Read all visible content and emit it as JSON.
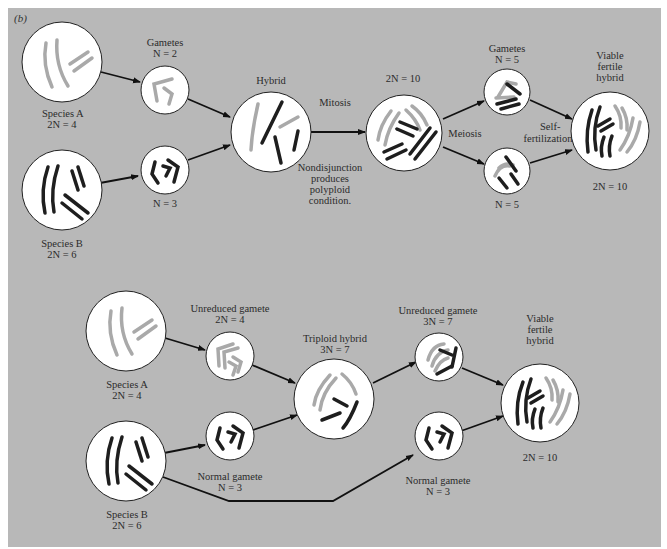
{
  "figure": {
    "panel_label": "(b)",
    "background_color": "#b8b8b8",
    "light_chromosome_color": "#a9a9a9",
    "dark_chromosome_color": "#1e1e1e"
  },
  "top_pathway": {
    "species_a": {
      "name": "Species A",
      "ploidy": "2N = 4"
    },
    "species_b": {
      "name": "Species B",
      "ploidy": "2N = 6"
    },
    "gametes_a": {
      "title": "Gametes",
      "ploidy": "N = 2"
    },
    "gametes_b": {
      "ploidy": "N = 3"
    },
    "hybrid": {
      "title": "Hybrid"
    },
    "mitosis_label": "Mitosis",
    "nondisjunction_note": [
      "Nondisjunction",
      "produces",
      "polyploid",
      "condition."
    ],
    "doubled": {
      "ploidy": "2N = 10"
    },
    "meiosis_label": "Meiosis",
    "gametes_top": {
      "title": "Gametes",
      "ploidy": "N = 5"
    },
    "gametes_bottom": {
      "ploidy": "N = 5"
    },
    "self_fertilization_label": [
      "Self-",
      "fertilization"
    ],
    "viable_hybrid": {
      "title": [
        "Viable",
        "fertile",
        "hybrid"
      ],
      "ploidy": "2N = 10"
    }
  },
  "bottom_pathway": {
    "species_a": {
      "name": "Species A",
      "ploidy": "2N = 4"
    },
    "species_b": {
      "name": "Species B",
      "ploidy": "2N = 6"
    },
    "unreduced_gamete_a": {
      "title": "Unreduced gamete",
      "ploidy": "2N = 4"
    },
    "normal_gamete_b": {
      "title": "Normal gamete",
      "ploidy": "N = 3"
    },
    "triploid_hybrid": {
      "title": "Triploid hybrid",
      "ploidy": "3N = 7"
    },
    "unreduced_gamete_triploid": {
      "title": "Unreduced gamete",
      "ploidy": "3N = 7"
    },
    "normal_gamete_b2": {
      "title": "Normal gamete",
      "ploidy": "N = 3"
    },
    "viable_hybrid": {
      "title": [
        "Viable",
        "fertile",
        "hybrid"
      ],
      "ploidy": "2N = 10"
    }
  }
}
